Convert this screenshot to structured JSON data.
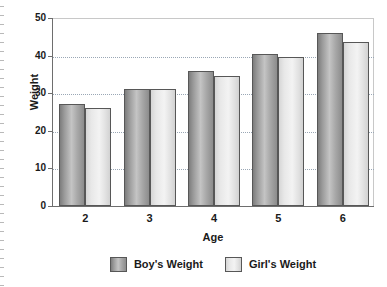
{
  "chart_data": {
    "type": "bar",
    "title": "",
    "xlabel": "Age",
    "ylabel": "Weight",
    "categories": [
      "2",
      "3",
      "4",
      "5",
      "6"
    ],
    "series": [
      {
        "name": "Boy's Weight",
        "values": [
          27,
          31,
          36,
          40.5,
          46
        ],
        "color": "#a8a8a8"
      },
      {
        "name": "Girl's Weight",
        "values": [
          26,
          31,
          34.5,
          39.5,
          43.5
        ],
        "color": "#ededed"
      }
    ],
    "ylim": [
      0,
      50
    ],
    "yticks": [
      0,
      10,
      20,
      30,
      40,
      50
    ],
    "ytick_labels": [
      "0",
      "10",
      "20",
      "30",
      "40",
      "50"
    ],
    "xtick_labels": [
      "2",
      "3",
      "4",
      "5",
      "6"
    ],
    "grid": true,
    "gridlines_at": [
      10,
      20,
      30,
      40
    ],
    "legend_position": "bottom"
  },
  "legend": {
    "items": [
      {
        "label": "Boy's Weight"
      },
      {
        "label": "Girl's Weight"
      }
    ]
  },
  "axes": {
    "y_title": "Weight",
    "x_title": "Age"
  }
}
